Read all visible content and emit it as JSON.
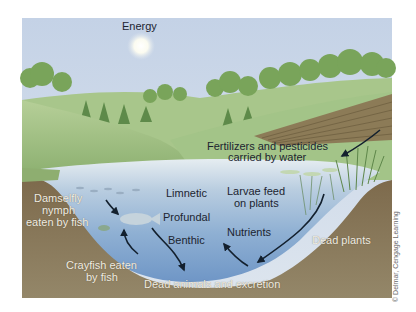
{
  "diagram": {
    "title_label": "Energy",
    "labels": {
      "energy": "Energy",
      "fertilizers_line1": "Fertilizers and pesticides",
      "fertilizers_line2": "carried by water",
      "limnetic": "Limnetic",
      "profundal": "Profundal",
      "benthic": "Benthic",
      "larvae_line1": "Larvae feed",
      "larvae_line2": "on plants",
      "nutrients": "Nutrients",
      "damselfly_line1": "Damselfly",
      "damselfly_line2": "nymph",
      "damselfly_line3": "eaten by fish",
      "crayfish_line1": "Crayfish eaten",
      "crayfish_line2": "by fish",
      "dead_animals": "Dead animals and excretion",
      "dead_plants": "Dead plants"
    },
    "copyright": "© Delmar, Cengage Learning",
    "colors": {
      "sky": "#c9d6e6",
      "hills": "#a9c48a",
      "trees": "#6f9a52",
      "water_surface": "#dfe8ee",
      "water_deep": "#7c9fc8",
      "soil": "#8e7e5f",
      "field": "#8a7a55",
      "arrow": "#13202e"
    }
  }
}
